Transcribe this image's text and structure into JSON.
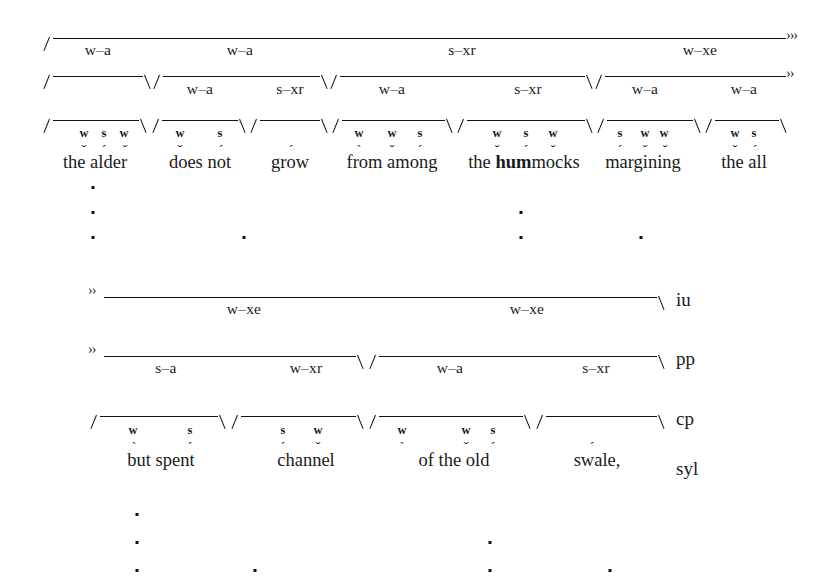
{
  "figure": {
    "ink_color": "#111111",
    "background": "#ffffff"
  },
  "tier_names": [
    {
      "label": "iu",
      "x": 676,
      "y": 289
    },
    {
      "label": "pp",
      "x": 676,
      "y": 348
    },
    {
      "label": "cp",
      "x": 676,
      "y": 408
    },
    {
      "label": "syl",
      "x": 676,
      "y": 458
    }
  ],
  "continuation_markers": [
    {
      "text": "›››",
      "x": 786,
      "y": 28
    },
    {
      "text": "››",
      "x": 786,
      "y": 66
    },
    {
      "text": "››",
      "x": 88,
      "y": 283
    },
    {
      "text": "››",
      "x": 88,
      "y": 342
    }
  ],
  "panel_top": {
    "brackets": [
      {
        "tier": "iu",
        "x1": 46,
        "x2": 786,
        "y": 38,
        "open_left": true,
        "open_right": false
      },
      {
        "tier": "pp",
        "x1": 46,
        "x2": 150,
        "y": 76,
        "open_left": true,
        "open_right": true
      },
      {
        "tier": "pp",
        "x1": 156,
        "x2": 327,
        "y": 76,
        "open_left": true,
        "open_right": true
      },
      {
        "tier": "pp",
        "x1": 333,
        "x2": 592,
        "y": 76,
        "open_left": true,
        "open_right": true
      },
      {
        "tier": "pp",
        "x1": 598,
        "x2": 786,
        "y": 76,
        "open_left": true,
        "open_right": false
      },
      {
        "tier": "cp",
        "x1": 46,
        "x2": 146,
        "y": 120,
        "open_left": true,
        "open_right": true
      },
      {
        "tier": "cp",
        "x1": 155,
        "x2": 245,
        "y": 120,
        "open_left": true,
        "open_right": true
      },
      {
        "tier": "cp",
        "x1": 253,
        "x2": 327,
        "y": 120,
        "open_left": true,
        "open_right": true
      },
      {
        "tier": "cp",
        "x1": 335,
        "x2": 452,
        "y": 120,
        "open_left": true,
        "open_right": true
      },
      {
        "tier": "cp",
        "x1": 460,
        "x2": 592,
        "y": 120,
        "open_left": true,
        "open_right": true
      },
      {
        "tier": "cp",
        "x1": 600,
        "x2": 700,
        "y": 120,
        "open_left": true,
        "open_right": true
      },
      {
        "tier": "cp",
        "x1": 708,
        "x2": 786,
        "y": 120,
        "open_left": true,
        "open_right": true
      }
    ],
    "node_labels": [
      {
        "text": "w–a",
        "x": 98,
        "y": 41
      },
      {
        "text": "w–a",
        "x": 240,
        "y": 41
      },
      {
        "text": "s–xr",
        "x": 462,
        "y": 41
      },
      {
        "text": "w–xe",
        "x": 700,
        "y": 41
      },
      {
        "text": "w–a",
        "x": 200,
        "y": 80
      },
      {
        "text": "s–xr",
        "x": 290,
        "y": 80
      },
      {
        "text": "w–a",
        "x": 392,
        "y": 80
      },
      {
        "text": "s–xr",
        "x": 528,
        "y": 80
      },
      {
        "text": "w–a",
        "x": 645,
        "y": 80
      },
      {
        "text": "w–a",
        "x": 744,
        "y": 80
      }
    ],
    "strength_marks": [
      {
        "text": "w",
        "x": 84,
        "y": 126
      },
      {
        "text": "s",
        "x": 104,
        "y": 126
      },
      {
        "text": "w",
        "x": 124,
        "y": 126
      },
      {
        "text": "w",
        "x": 180,
        "y": 126
      },
      {
        "text": "s",
        "x": 220,
        "y": 126
      },
      {
        "text": "w",
        "x": 359,
        "y": 126
      },
      {
        "text": "w",
        "x": 392,
        "y": 126
      },
      {
        "text": "s",
        "x": 420,
        "y": 126
      },
      {
        "text": "w",
        "x": 497,
        "y": 126
      },
      {
        "text": "s",
        "x": 526,
        "y": 126
      },
      {
        "text": "w",
        "x": 553,
        "y": 126
      },
      {
        "text": "s",
        "x": 620,
        "y": 126
      },
      {
        "text": "w",
        "x": 645,
        "y": 126
      },
      {
        "text": "w",
        "x": 664,
        "y": 126
      },
      {
        "text": "w",
        "x": 735,
        "y": 126
      },
      {
        "text": "s",
        "x": 754,
        "y": 126
      }
    ],
    "accents": [
      {
        "text": "ˇ",
        "x": 84,
        "y": 143
      },
      {
        "text": "´",
        "x": 104,
        "y": 143
      },
      {
        "text": "ˇ",
        "x": 125,
        "y": 143
      },
      {
        "text": "ˇ",
        "x": 180,
        "y": 143
      },
      {
        "text": "´",
        "x": 221,
        "y": 143
      },
      {
        "text": "´",
        "x": 291,
        "y": 143
      },
      {
        "text": "`",
        "x": 359,
        "y": 143
      },
      {
        "text": "ˇ",
        "x": 392,
        "y": 143
      },
      {
        "text": "´",
        "x": 420,
        "y": 143
      },
      {
        "text": "ˇ",
        "x": 497,
        "y": 143
      },
      {
        "text": "´",
        "x": 526,
        "y": 143
      },
      {
        "text": "ˇ",
        "x": 553,
        "y": 143
      },
      {
        "text": "´",
        "x": 620,
        "y": 143
      },
      {
        "text": "ˇ",
        "x": 645,
        "y": 143
      },
      {
        "text": "ˇ",
        "x": 665,
        "y": 143
      },
      {
        "text": "ˇ",
        "x": 735,
        "y": 143
      },
      {
        "text": "´",
        "x": 755,
        "y": 143
      }
    ],
    "words": [
      {
        "html": "the alder",
        "x": 95,
        "y": 152
      },
      {
        "html": "does not",
        "x": 200,
        "y": 152
      },
      {
        "html": "grow",
        "x": 290,
        "y": 152
      },
      {
        "html": "from among",
        "x": 392,
        "y": 152
      },
      {
        "html": "the <b>hum</b>mocks",
        "x": 524,
        "y": 152
      },
      {
        "html": "margining",
        "x": 643,
        "y": 152
      },
      {
        "html": "the all",
        "x": 744,
        "y": 152
      }
    ],
    "grid_dots": [
      {
        "x": 93,
        "y": 186
      },
      {
        "x": 93,
        "y": 211
      },
      {
        "x": 93,
        "y": 236
      },
      {
        "x": 244,
        "y": 236
      },
      {
        "x": 521,
        "y": 211
      },
      {
        "x": 521,
        "y": 236
      },
      {
        "x": 641,
        "y": 236
      }
    ]
  },
  "panel_bottom": {
    "brackets": [
      {
        "tier": "iu",
        "x1": 104,
        "x2": 664,
        "y": 297,
        "open_left": false,
        "open_right": true
      },
      {
        "tier": "pp",
        "x1": 104,
        "x2": 363,
        "y": 356,
        "open_left": false,
        "open_right": true
      },
      {
        "tier": "pp",
        "x1": 372,
        "x2": 664,
        "y": 356,
        "open_left": true,
        "open_right": true
      },
      {
        "tier": "cp",
        "x1": 93,
        "x2": 225,
        "y": 416,
        "open_left": true,
        "open_right": true
      },
      {
        "tier": "cp",
        "x1": 234,
        "x2": 363,
        "y": 416,
        "open_left": true,
        "open_right": true
      },
      {
        "tier": "cp",
        "x1": 372,
        "x2": 530,
        "y": 416,
        "open_left": true,
        "open_right": true
      },
      {
        "tier": "cp",
        "x1": 539,
        "x2": 664,
        "y": 416,
        "open_left": true,
        "open_right": true
      }
    ],
    "node_labels": [
      {
        "text": "w–xe",
        "x": 244,
        "y": 300
      },
      {
        "text": "w–xe",
        "x": 527,
        "y": 300
      },
      {
        "text": "s–a",
        "x": 166,
        "y": 359
      },
      {
        "text": "w–xr",
        "x": 306,
        "y": 359
      },
      {
        "text": "w–a",
        "x": 450,
        "y": 359
      },
      {
        "text": "s–xr",
        "x": 596,
        "y": 359
      }
    ],
    "strength_marks": [
      {
        "text": "w",
        "x": 133,
        "y": 423
      },
      {
        "text": "s",
        "x": 190,
        "y": 423
      },
      {
        "text": "s",
        "x": 283,
        "y": 423
      },
      {
        "text": "w",
        "x": 318,
        "y": 423
      },
      {
        "text": "w",
        "x": 402,
        "y": 423
      },
      {
        "text": "w",
        "x": 466,
        "y": 423
      },
      {
        "text": "s",
        "x": 493,
        "y": 423
      }
    ],
    "accents": [
      {
        "text": "`",
        "x": 134,
        "y": 440
      },
      {
        "text": "´",
        "x": 190,
        "y": 440
      },
      {
        "text": "´",
        "x": 283,
        "y": 440
      },
      {
        "text": "ˇ",
        "x": 318,
        "y": 440
      },
      {
        "text": "`",
        "x": 402,
        "y": 440
      },
      {
        "text": "ˇ",
        "x": 466,
        "y": 440
      },
      {
        "text": "´",
        "x": 493,
        "y": 440
      },
      {
        "text": "´",
        "x": 592,
        "y": 440
      }
    ],
    "words": [
      {
        "html": "but spent",
        "x": 161,
        "y": 450
      },
      {
        "html": "channel",
        "x": 306,
        "y": 450
      },
      {
        "html": "of the old",
        "x": 454,
        "y": 450
      },
      {
        "html": "swale,",
        "x": 597,
        "y": 450
      }
    ],
    "grid_dots": [
      {
        "x": 137,
        "y": 513
      },
      {
        "x": 137,
        "y": 541
      },
      {
        "x": 137,
        "y": 569
      },
      {
        "x": 255,
        "y": 569
      },
      {
        "x": 490,
        "y": 541
      },
      {
        "x": 490,
        "y": 569
      },
      {
        "x": 610,
        "y": 569
      }
    ]
  }
}
